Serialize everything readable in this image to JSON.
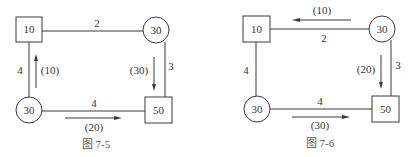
{
  "figures": [
    {
      "caption": "图 7-5",
      "nodes": {
        "top_left": {
          "shape": "square",
          "value": "10"
        },
        "top_right": {
          "shape": "circle",
          "value": "30"
        },
        "bottom_left": {
          "shape": "circle",
          "value": "30"
        },
        "bottom_right": {
          "shape": "square",
          "value": "50"
        }
      },
      "edges": {
        "top": {
          "cost": "2"
        },
        "left": {
          "cost": "4",
          "flow": "(10)",
          "flow_direction": "up"
        },
        "right": {
          "cost": "3",
          "flow": "(30)",
          "flow_direction": "down"
        },
        "bottom": {
          "cost": "4",
          "flow": "(20)",
          "flow_direction": "right"
        }
      }
    },
    {
      "caption": "图 7-6",
      "nodes": {
        "top_left": {
          "shape": "square",
          "value": "10"
        },
        "top_right": {
          "shape": "circle",
          "value": "30"
        },
        "bottom_left": {
          "shape": "circle",
          "value": "30"
        },
        "bottom_right": {
          "shape": "square",
          "value": "50"
        }
      },
      "edges": {
        "top": {
          "cost": "2",
          "flow": "(10)",
          "flow_direction": "left"
        },
        "left": {
          "cost": "4"
        },
        "right": {
          "cost": "3",
          "flow": "(20)",
          "flow_direction": "down"
        },
        "bottom": {
          "cost": "4",
          "flow": "(30)",
          "flow_direction": "right"
        }
      }
    }
  ]
}
